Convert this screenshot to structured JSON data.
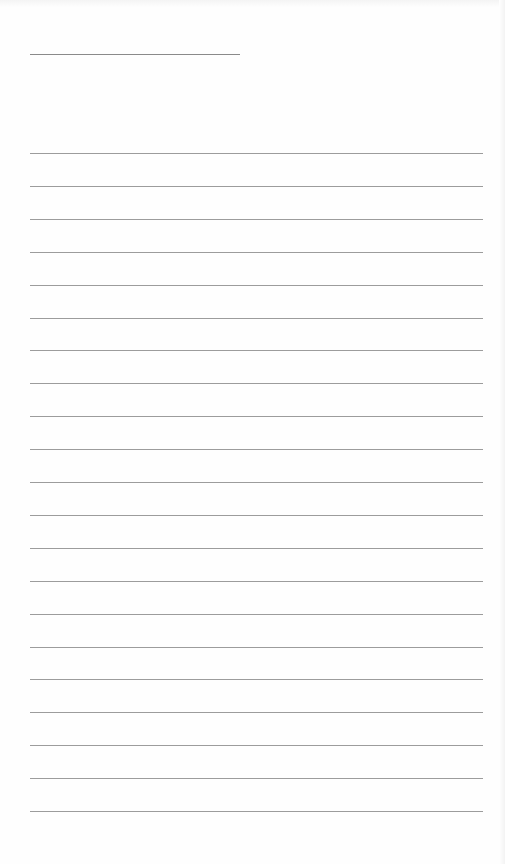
{
  "page": {
    "type": "lined-notebook-page",
    "background_color": "#fefefe",
    "rule_color": "#9c9c9c",
    "title_rule": {
      "x": 30,
      "y": 54,
      "width": 210
    },
    "rules": {
      "x": 30,
      "width": 453,
      "start_y": 153,
      "spacing": 32.9,
      "count": 21
    },
    "text": []
  }
}
